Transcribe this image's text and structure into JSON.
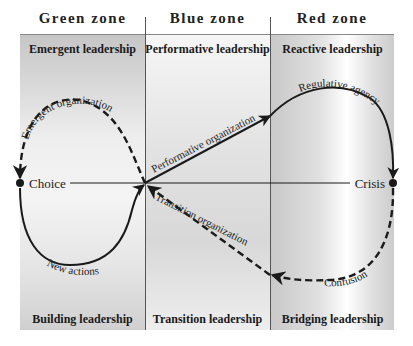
{
  "zones": [
    {
      "name": "Green zone",
      "top_label": "Emergent leadership",
      "bottom_label": "Building leadership"
    },
    {
      "name": "Blue zone",
      "top_label": "Performative leadership",
      "bottom_label": "Transition leadership"
    },
    {
      "name": "Red zone",
      "top_label": "Reactive leadership",
      "bottom_label": "Bridging leadership"
    }
  ],
  "nodes": {
    "left": "Choice",
    "right": "Crisis"
  },
  "paths": {
    "emergent": "Emergent organization",
    "new_actions": "New actions",
    "performative": "Performative organization",
    "regulative": "Regulative agency",
    "confusion": "Confusion",
    "transition": "Transition organization"
  },
  "colors": {
    "line": "#1a1a1a",
    "panel_gray": "#d0d0d0"
  }
}
